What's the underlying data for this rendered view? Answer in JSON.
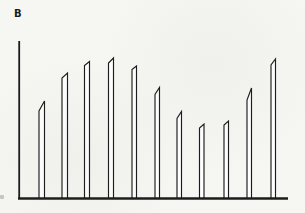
{
  "figure": {
    "panel_label": "B",
    "background_color": "#f6f6f3",
    "ink_color": "#1b1b1b",
    "bar_fill_color": "#ffffff"
  },
  "chart_data": {
    "type": "bar",
    "title": "",
    "xlabel": "",
    "ylabel": "",
    "legend": "none",
    "grid": false,
    "tick_labels": "none (axes are unlabeled line-art)",
    "style_note": "thin outlined white bars with slanted pen-stroke tops on a baseline; single vertical axis at left",
    "n_bars": 11,
    "values_px_height": [
      98,
      126,
      137.5,
      141,
      133,
      111.5,
      87.5,
      75,
      78,
      111,
      140
    ],
    "baseline_y": 198.5,
    "bar_bottom_y": 199,
    "axis": {
      "y_axis_x": 19.2,
      "y_axis_top": 41,
      "y_axis_width": 1.8,
      "baseline_x1": 18,
      "baseline_x2": 288,
      "baseline_width": 2.4
    },
    "bar_stroke_width": 1.15,
    "bars": [
      {
        "x1": 39.0,
        "x2": 44.5,
        "bevel_y": 111.0,
        "peak_y": 101.0
      },
      {
        "x1": 62.0,
        "x2": 67.5,
        "bevel_y": 78.0,
        "peak_y": 73.0
      },
      {
        "x1": 84.5,
        "x2": 89.5,
        "bevel_y": 65.5,
        "peak_y": 61.5
      },
      {
        "x1": 108.5,
        "x2": 113.5,
        "bevel_y": 63.0,
        "peak_y": 58.0
      },
      {
        "x1": 132.0,
        "x2": 136.5,
        "bevel_y": 69.5,
        "peak_y": 66.0
      },
      {
        "x1": 155.0,
        "x2": 159.5,
        "bevel_y": 94.5,
        "peak_y": 87.5
      },
      {
        "x1": 177.0,
        "x2": 181.5,
        "bevel_y": 118.5,
        "peak_y": 111.5
      },
      {
        "x1": 199.5,
        "x2": 204.0,
        "bevel_y": 128.0,
        "peak_y": 124.0
      },
      {
        "x1": 224.0,
        "x2": 228.5,
        "bevel_y": 125.0,
        "peak_y": 121.0
      },
      {
        "x1": 247.0,
        "x2": 251.5,
        "bevel_y": 100.0,
        "peak_y": 88.0
      },
      {
        "x1": 271.0,
        "x2": 275.5,
        "bevel_y": 65.0,
        "peak_y": 59.0
      }
    ]
  }
}
